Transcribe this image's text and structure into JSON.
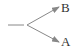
{
  "diagram": {
    "type": "branching-arrow",
    "line_color": "#888888",
    "text_color": "#333333",
    "nodes": [
      {
        "id": "B",
        "label": "B",
        "position": "upper-right"
      },
      {
        "id": "A",
        "label": "A",
        "position": "lower-right"
      }
    ],
    "edges": [
      {
        "from": "origin",
        "to": "B"
      },
      {
        "from": "origin",
        "to": "A"
      }
    ]
  }
}
